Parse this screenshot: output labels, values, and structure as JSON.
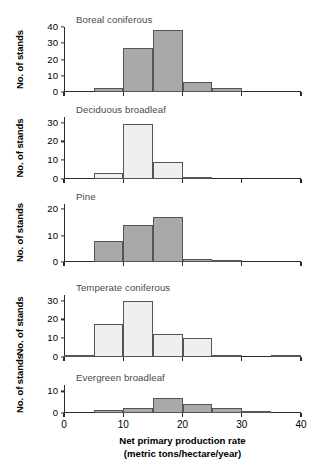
{
  "figure": {
    "axis": {
      "x_title_line1": "Net primary production rate",
      "x_title_line2": "(metric tons/hectare/year)",
      "y_title": "No. of stands",
      "x_ticks": [
        "0",
        "10",
        "20",
        "30",
        "40"
      ],
      "x_min": 0,
      "x_max": 40,
      "bin_width": 5
    },
    "colors": {
      "bar_dark": "#a9a9a9",
      "bar_light": "#efefef",
      "bar_edge": "#555555",
      "axis": "#2b2b2b",
      "title_text": "#4a4a4a"
    }
  },
  "chart_data": [
    {
      "type": "bar",
      "title": "Boreal coniferous",
      "xlabel": "Net primary production rate (metric tons/hectare/year)",
      "ylabel": "No. of stands",
      "xlim": [
        0,
        40
      ],
      "ylim": [
        0,
        40
      ],
      "yticks": [
        0,
        10,
        20,
        30,
        40
      ],
      "grid": false,
      "fill": "dark",
      "bin_edges": [
        0,
        5,
        10,
        15,
        20,
        25,
        30,
        35,
        40
      ],
      "categories": [
        "0-5",
        "5-10",
        "10-15",
        "15-20",
        "20-25",
        "25-30",
        "30-35",
        "35-40"
      ],
      "values": [
        0,
        2.5,
        27,
        38,
        6,
        2.5,
        0,
        0
      ]
    },
    {
      "type": "bar",
      "title": "Deciduous broadleaf",
      "xlabel": "Net primary production rate (metric tons/hectare/year)",
      "ylabel": "No. of stands",
      "xlim": [
        0,
        40
      ],
      "ylim": [
        0,
        33
      ],
      "yticks": [
        0,
        10,
        20,
        30
      ],
      "grid": false,
      "fill": "light",
      "bin_edges": [
        0,
        5,
        10,
        15,
        20,
        25,
        30,
        35,
        40
      ],
      "categories": [
        "0-5",
        "5-10",
        "10-15",
        "15-20",
        "20-25",
        "25-30",
        "30-35",
        "35-40"
      ],
      "values": [
        0,
        3,
        29.5,
        9,
        1,
        0,
        0,
        0
      ]
    },
    {
      "type": "bar",
      "title": "Pine",
      "xlabel": "Net primary production rate (metric tons/hectare/year)",
      "ylabel": "No. of stands",
      "xlim": [
        0,
        40
      ],
      "ylim": [
        0,
        22
      ],
      "yticks": [
        0,
        10,
        20
      ],
      "grid": false,
      "fill": "dark",
      "bin_edges": [
        0,
        5,
        10,
        15,
        20,
        25,
        30,
        35,
        40
      ],
      "categories": [
        "0-5",
        "5-10",
        "10-15",
        "15-20",
        "20-25",
        "25-30",
        "30-35",
        "35-40"
      ],
      "values": [
        0,
        8,
        14,
        17,
        1,
        0.6,
        0,
        0
      ]
    },
    {
      "type": "bar",
      "title": "Temperate coniferous",
      "xlabel": "Net primary production rate (metric tons/hectare/year)",
      "ylabel": "No. of stands",
      "xlim": [
        0,
        40
      ],
      "ylim": [
        0,
        33
      ],
      "yticks": [
        0,
        10,
        20,
        30
      ],
      "grid": false,
      "fill": "light",
      "bin_edges": [
        0,
        5,
        10,
        15,
        20,
        25,
        30,
        35,
        40
      ],
      "categories": [
        "0-5",
        "5-10",
        "10-15",
        "15-20",
        "20-25",
        "25-30",
        "30-35",
        "35-40"
      ],
      "values": [
        0.4,
        17.5,
        30,
        12,
        10,
        1,
        0,
        0.7
      ]
    },
    {
      "type": "bar",
      "title": "Evergreen broadleaf",
      "xlabel": "Net primary production rate (metric tons/hectare/year)",
      "ylabel": "No. of stands",
      "xlim": [
        0,
        40
      ],
      "ylim": [
        0,
        13
      ],
      "yticks": [
        0,
        10
      ],
      "grid": false,
      "fill": "dark",
      "bin_edges": [
        0,
        5,
        10,
        15,
        20,
        25,
        30,
        35,
        40
      ],
      "categories": [
        "0-5",
        "5-10",
        "10-15",
        "15-20",
        "20-25",
        "25-30",
        "30-35",
        "35-40"
      ],
      "values": [
        0,
        1.2,
        2.5,
        7,
        4,
        2.5,
        1,
        0
      ]
    }
  ]
}
